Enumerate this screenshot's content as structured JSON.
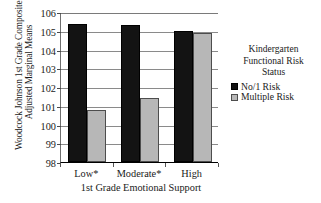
{
  "chart_data": {
    "type": "bar",
    "title": "",
    "xlabel": "1st Grade Emotional Support",
    "ylabel_line1": "Woodcock Johnson 1st Grade Composites-",
    "ylabel_line2": "Adjusted Marginal Means",
    "categories": [
      "Low*",
      "Moderate*",
      "High"
    ],
    "ylim": [
      98,
      106
    ],
    "yticks": [
      98,
      99,
      100,
      101,
      102,
      103,
      104,
      105,
      106
    ],
    "ytick_labels": [
      "98",
      "99",
      "100",
      "101",
      "102",
      "103",
      "104",
      "105",
      "106"
    ],
    "grid": true,
    "legend_position": "right",
    "legend_title_lines": [
      "Kindergarten",
      "Functional Risk",
      "Status"
    ],
    "series": [
      {
        "name": "No/1 Risk",
        "color": "#131313",
        "values": [
          105.35,
          105.3,
          105.0
        ]
      },
      {
        "name": "Multiple Risk",
        "color": "#b7b7b7",
        "values": [
          100.8,
          101.4,
          104.9
        ]
      }
    ]
  },
  "colors": {
    "no_risk": "#131313",
    "multiple_risk": "#b7b7b7",
    "axis": "#000000",
    "grid": "#8a8a8a",
    "background": "#ffffff"
  }
}
